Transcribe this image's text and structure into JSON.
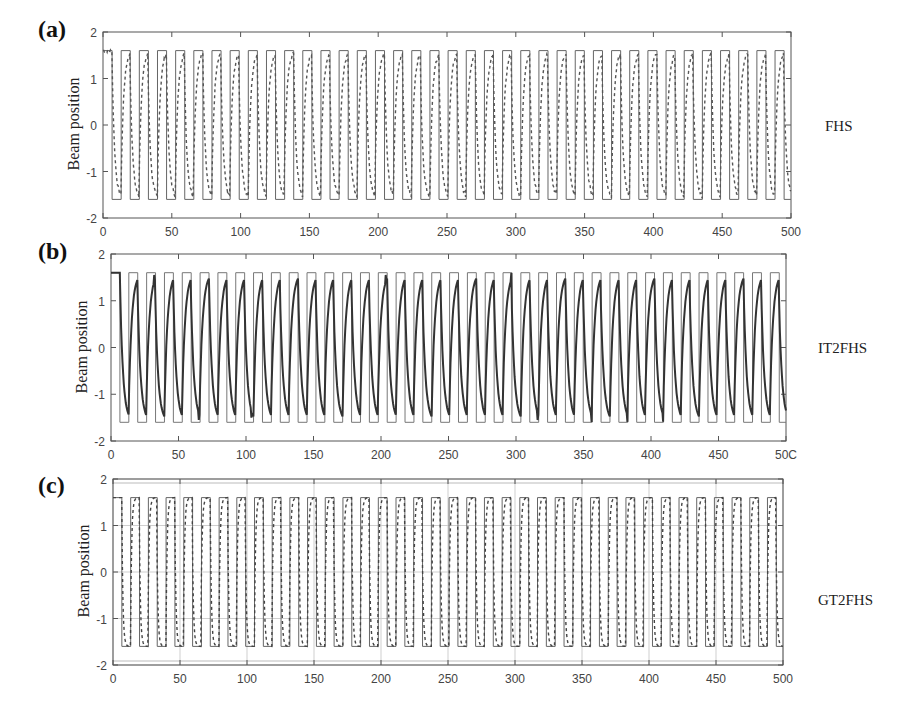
{
  "figure": {
    "panels": [
      {
        "letter": "(a)",
        "method": "FHS",
        "ylabel": "Beam position"
      },
      {
        "letter": "(b)",
        "method": "IT2FHS",
        "ylabel": "Beam position"
      },
      {
        "letter": "(c)",
        "method": "GT2FHS",
        "ylabel": "Beam position"
      }
    ]
  },
  "chart_data": [
    {
      "type": "line",
      "title": "(a) FHS",
      "xlabel": "",
      "ylabel": "Beam position",
      "xlim": [
        0,
        500
      ],
      "ylim": [
        -2,
        2
      ],
      "xticks": [
        0,
        50,
        100,
        150,
        200,
        250,
        300,
        350,
        400,
        450,
        500
      ],
      "yticks": [
        -2,
        -1,
        0,
        1,
        2
      ],
      "grid": false,
      "series": [
        {
          "name": "Reference (square wave)",
          "style": "solid-thin",
          "amplitude": 1.6,
          "period": 13.2,
          "color": "#666666"
        },
        {
          "name": "FHS response",
          "style": "dashed",
          "amplitude": 1.6,
          "overshoot_max": 1.8,
          "color": "#555555"
        }
      ]
    },
    {
      "type": "line",
      "title": "(b) IT2FHS",
      "xlabel": "",
      "ylabel": "Beam position",
      "xlim": [
        0,
        500
      ],
      "ylim": [
        -2,
        2
      ],
      "xticks": [
        0,
        50,
        100,
        150,
        200,
        250,
        300,
        350,
        400,
        450,
        500
      ],
      "xticklabels": [
        "0",
        "50",
        "100",
        "150",
        "200",
        "250",
        "300",
        "350",
        "400",
        "450",
        "50C"
      ],
      "yticks": [
        -2,
        -1,
        0,
        1,
        2
      ],
      "grid": false,
      "series": [
        {
          "name": "Reference (square wave)",
          "style": "solid-thin",
          "amplitude": 1.6,
          "period": 13.2,
          "color": "#777777"
        },
        {
          "name": "IT2FHS response",
          "style": "solid-thick",
          "amplitude": 1.6,
          "overshoot_max": 1.8,
          "undershoot_min": -1.8,
          "color": "#333333"
        }
      ]
    },
    {
      "type": "line",
      "title": "(c) GT2FHS",
      "xlabel": "",
      "ylabel": "Beam position",
      "xlim": [
        0,
        500
      ],
      "ylim": [
        -2,
        2
      ],
      "xticks": [
        0,
        50,
        100,
        150,
        200,
        250,
        300,
        350,
        400,
        450,
        500
      ],
      "yticks": [
        -2,
        -1,
        0,
        1,
        2
      ],
      "grid": true,
      "series": [
        {
          "name": "Reference (square wave)",
          "style": "solid-thin",
          "amplitude": 1.6,
          "period": 13.2,
          "color": "#666666"
        },
        {
          "name": "GT2FHS response",
          "style": "dashed",
          "amplitude": 1.6,
          "color": "#444444"
        }
      ]
    }
  ],
  "layout": [
    {
      "top": 0,
      "letter_pos": [
        38,
        16
      ],
      "frame": [
        103,
        32,
        791,
        218
      ],
      "ylabel_pos": [
        74,
        125
      ],
      "method_pos": [
        825,
        118
      ],
      "x0label": "0"
    },
    {
      "top": 0,
      "letter_pos": [
        38,
        238
      ],
      "frame": [
        111,
        254,
        786,
        441
      ],
      "ylabel_pos": [
        82,
        348
      ],
      "method_pos": [
        818,
        340
      ]
    },
    {
      "top": 0,
      "letter_pos": [
        38,
        472
      ],
      "frame": [
        113,
        479,
        783,
        665
      ],
      "ylabel_pos": [
        84,
        572
      ],
      "method_pos": [
        818,
        592
      ]
    }
  ]
}
